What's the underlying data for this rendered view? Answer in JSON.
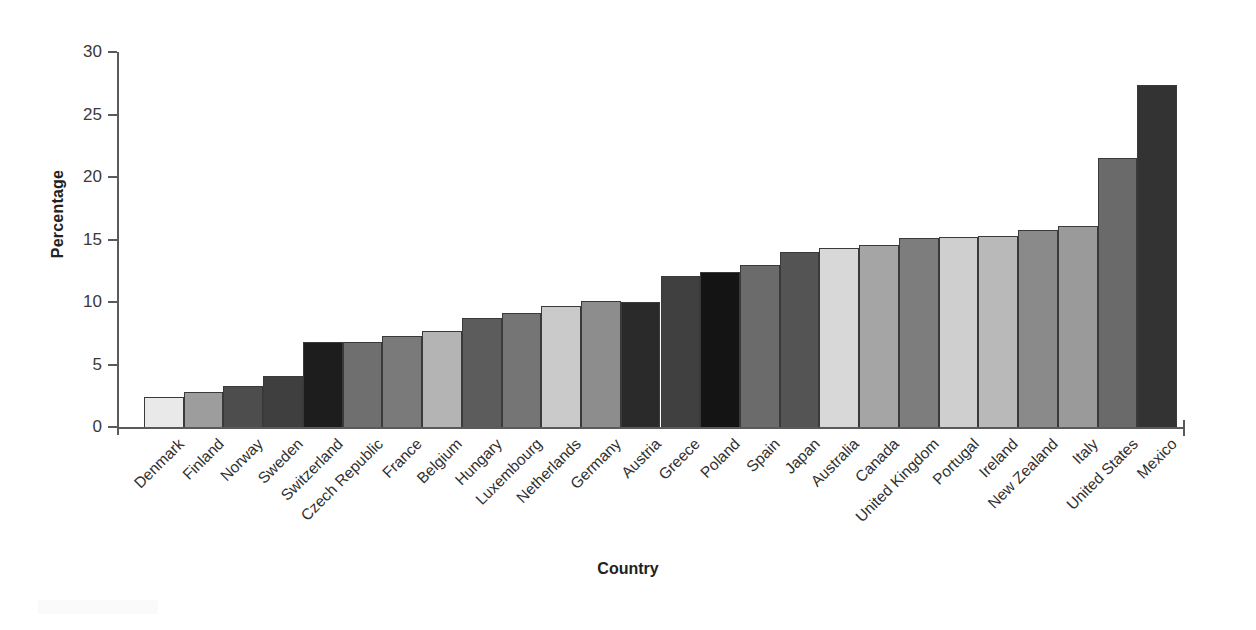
{
  "chart_data": {
    "type": "bar",
    "title": "",
    "xlabel": "Country",
    "ylabel": "Percentage",
    "ylim": [
      0,
      30
    ],
    "yticks": [
      0,
      5,
      10,
      15,
      20,
      25,
      30
    ],
    "ytick_labels": [
      "0",
      "5",
      "10",
      "15",
      "20",
      "25",
      "30"
    ],
    "grid": false,
    "legend": "none",
    "orientation": "vertical",
    "categories": [
      "Denmark",
      "Finland",
      "Norway",
      "Sweden",
      "Switzerland",
      "Czech Republic",
      "France",
      "Belgium",
      "Hungary",
      "Luxembourg",
      "Netherlands",
      "Germany",
      "Austria",
      "Greece",
      "Poland",
      "Spain",
      "Japan",
      "Australia",
      "Canada",
      "United Kingdom",
      "Portugal",
      "Ireland",
      "New Zealand",
      "Italy",
      "United States",
      "Mexico"
    ],
    "values": [
      2.4,
      2.8,
      3.3,
      4.1,
      6.8,
      6.8,
      7.3,
      7.7,
      8.7,
      9.1,
      9.7,
      10.1,
      10.0,
      12.1,
      12.4,
      13.0,
      14.0,
      14.3,
      14.6,
      15.1,
      15.2,
      15.3,
      15.8,
      16.1,
      21.5,
      27.4
    ],
    "bar_colors": [
      "#e9e9e9",
      "#9d9d9d",
      "#4d4d4d",
      "#3f3f3f",
      "#1d1d1d",
      "#6f6f6f",
      "#7a7a7a",
      "#b4b4b4",
      "#5c5c5c",
      "#757575",
      "#cacaca",
      "#8d8d8d",
      "#2a2a2a",
      "#404040",
      "#141414",
      "#6b6b6b",
      "#545454",
      "#d8d8d8",
      "#a5a5a5",
      "#7d7d7d",
      "#cfcfcf",
      "#b9b9b9",
      "#8a8a8a",
      "#9a9a9a",
      "#6a6a6a",
      "#333333"
    ]
  },
  "axes": {
    "y_title": "Percentage",
    "x_title": "Country"
  }
}
